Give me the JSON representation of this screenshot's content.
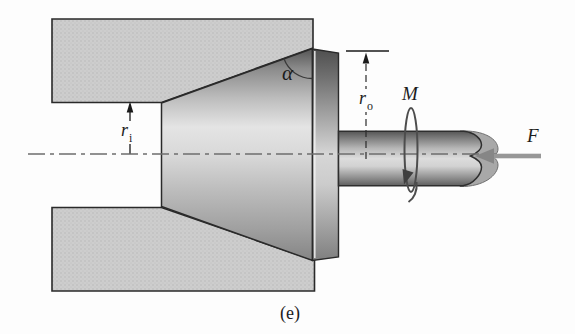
{
  "figure": {
    "caption": "(e)"
  },
  "labels": {
    "cone_angle": "α",
    "inner_radius_base": "r",
    "inner_radius_sub": "i",
    "outer_radius_base": "r",
    "outer_radius_sub": "o",
    "moment": "M",
    "force": "F"
  },
  "colors": {
    "background": "#fdfdfd",
    "housing_fill": "#cdcdcd",
    "housing_dot": "#b5b5b5",
    "outline": "#2a2a2a",
    "metal_shadow": "#5e5e5e",
    "metal_highlight": "#e4e4e4",
    "centerline": "#6e6e6e",
    "dimension_ink": "#1a1a1a",
    "moment_arrow": "#4d4d4d",
    "force_arrow_head": "#868686",
    "force_arrow_stem": "#979797"
  }
}
